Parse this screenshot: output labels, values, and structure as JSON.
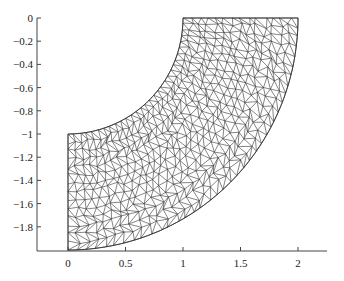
{
  "chart_data": {
    "type": "mesh",
    "title": "",
    "xlabel": "",
    "ylabel": "",
    "xlim": [
      -0.27,
      2.26
    ],
    "ylim": [
      -2.0,
      0.0
    ],
    "x_ticks": [
      0,
      0.5,
      1,
      1.5,
      2
    ],
    "x_tick_labels": [
      "0",
      "0.5",
      "1",
      "1.5",
      "2"
    ],
    "y_ticks": [
      0,
      -0.2,
      -0.4,
      -0.6,
      -0.8,
      -1,
      -1.2,
      -1.4,
      -1.6,
      -1.8
    ],
    "y_tick_labels": [
      "0",
      "-0.2",
      "-0.4",
      "-0.6",
      "-0.8",
      "-1",
      "-1.2",
      "-1.4",
      "-1.6",
      "-1.8"
    ],
    "grid": false,
    "geometry": {
      "shape": "quarter annulus",
      "center": [
        0,
        0
      ],
      "inner_radius": 1,
      "outer_radius": 2,
      "angle_range_deg": [
        -90,
        0
      ]
    },
    "mesh": {
      "element_type": "triangle",
      "radial_divisions": 14,
      "angular_divisions": 30
    },
    "colors": {
      "mesh_line": "#333333",
      "axis": "#444444"
    }
  }
}
